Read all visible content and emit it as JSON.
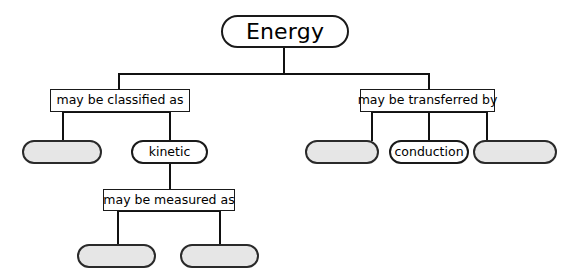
{
  "diagram": {
    "title": "Energy",
    "type": "concept-map",
    "colors": {
      "stroke": "#1a1a1a",
      "blank_fill": "#e6e6e6",
      "node_fill": "#ffffff",
      "text": "#000000",
      "background": "#ffffff"
    },
    "root": {
      "label": "Energy"
    },
    "linking_phrases": [
      {
        "id": "classified",
        "label": "may be classified as"
      },
      {
        "id": "transferred",
        "label": "may be transferred by"
      },
      {
        "id": "measured",
        "label": "may be measured as"
      }
    ],
    "concepts": [
      {
        "id": "classified-blank-1",
        "label": "",
        "blank": true,
        "branch": "may be classified as"
      },
      {
        "id": "kinetic",
        "label": "kinetic",
        "blank": false,
        "branch": "may be classified as"
      },
      {
        "id": "transferred-blank-1",
        "label": "",
        "blank": true,
        "branch": "may be transferred by"
      },
      {
        "id": "conduction",
        "label": "conduction",
        "blank": false,
        "branch": "may be transferred by"
      },
      {
        "id": "transferred-blank-2",
        "label": "",
        "blank": true,
        "branch": "may be transferred by"
      },
      {
        "id": "measured-blank-1",
        "label": "",
        "blank": true,
        "branch": "may be measured as"
      },
      {
        "id": "measured-blank-2",
        "label": "",
        "blank": true,
        "branch": "may be measured as"
      }
    ]
  }
}
